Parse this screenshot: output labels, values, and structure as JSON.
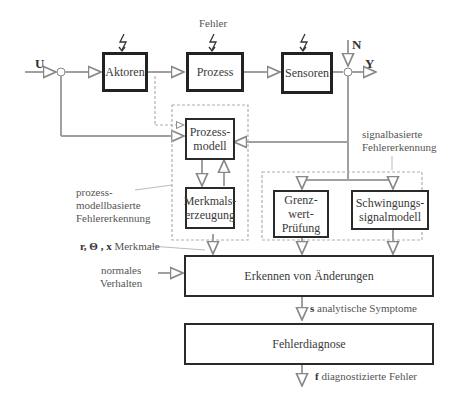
{
  "signals": {
    "input": "U",
    "noise": "N",
    "output": "Y",
    "fault_label": "Fehler"
  },
  "blocks": {
    "actuators": "Aktoren",
    "process": "Prozess",
    "sensors": "Sensoren",
    "process_model": "Prozess-\nmodell",
    "feature_generation": "Merkmals-\nerzeugung",
    "limit_check": "Grenz-\nwert-\nPrüfung",
    "vibration_model": "Schwingungs-\nsignalmodell",
    "change_detection": "Erkennen von Änderungen",
    "fault_diagnosis": "Fehlerdiagnose"
  },
  "annotations": {
    "model_based_group": "prozess-\nmodellbasierte\nFehlererkennung",
    "signal_based_group": "signalbasierte\nFehlererkennung",
    "features_symbols": "r, Θ , x",
    "features_text": "Merkmale",
    "normal_behavior": "normales\nVerhalten",
    "symptoms_symbol": "s",
    "symptoms_text": "analytische Symptome",
    "faults_symbol": "f",
    "faults_text": "diagnostizierte Fehler"
  },
  "colors": {
    "box_border": "#2a2a2a",
    "line": "#9a9a9a",
    "dashed_group": "#b0b0b0",
    "text": "#4a4a4a"
  }
}
